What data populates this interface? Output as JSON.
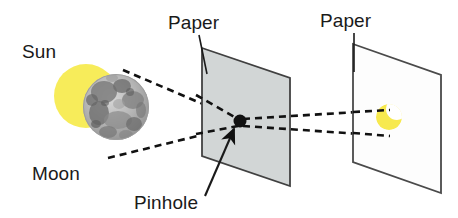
{
  "figure": {
    "title_visible": false,
    "background_color": "#ffffff",
    "topic": "pinhole-camera-solar-eclipse-projection"
  },
  "labels": [
    {
      "id": "sun",
      "text": "Sun",
      "x": 22,
      "y": 58,
      "anchor": "start"
    },
    {
      "id": "paper1",
      "text": "Paper",
      "x": 168,
      "y": 29,
      "anchor": "start"
    },
    {
      "id": "paper2",
      "text": "Paper",
      "x": 320,
      "y": 27,
      "anchor": "start"
    },
    {
      "id": "moon",
      "text": "Moon",
      "x": 32,
      "y": 180,
      "anchor": "start"
    },
    {
      "id": "pinhole",
      "text": "Pinhole",
      "x": 134,
      "y": 209,
      "anchor": "start"
    }
  ],
  "colors": {
    "sun_yellow": "#f7ec5a",
    "crescent_yellow": "#f7e94f",
    "moon_gray_light": "#c9c9c9",
    "moon_gray_mid": "#9b9b9b",
    "moon_gray_dark": "#6e6e6e",
    "paper_fill_gray": "#d2d6d6",
    "paper_fill_white": "#fdfdfd",
    "paper_stroke": "#4a4a4a",
    "ray_black": "#111111",
    "text_black": "#1a1a1a",
    "background": "#ffffff"
  },
  "objects": {
    "sun": {
      "name": "Sun",
      "shape": "circle",
      "center_x": 86,
      "center_y": 96,
      "radius": 32,
      "color": "#f7ec5a"
    },
    "moon": {
      "name": "Moon",
      "shape": "circle",
      "center_x": 116,
      "center_y": 107,
      "radius": 33,
      "color": "#9b9b9b",
      "description": "textured cratered gray disk overlapping the sun"
    },
    "paper_with_pinhole": {
      "name": "Paper",
      "shape": "parallelogram",
      "fill": "#d2d6d6",
      "points": "202,48 290,78 290,186 202,156",
      "has_pinhole": true
    },
    "pinhole": {
      "name": "Pinhole",
      "shape": "dot",
      "center_x": 240,
      "center_y": 121,
      "radius": 6.5,
      "color": "#111111"
    },
    "screen_paper": {
      "name": "Paper",
      "shape": "parallelogram",
      "fill": "#fdfdfd",
      "points": "353,44 441,75 441,193 353,162"
    },
    "projected_image": {
      "name": "crescent",
      "shape": "crescent",
      "center_x": 389,
      "center_y": 117,
      "radius": 13,
      "color": "#f7e94f",
      "description": "inverted crescent image of the partially eclipsed sun"
    }
  },
  "rays": {
    "style": "dashed",
    "dash_pattern": "7 5",
    "stroke_width": 2.6,
    "paths": [
      {
        "id": "ray-upper-to-pinhole",
        "from": "sun-top",
        "to": "pinhole",
        "d": "M 123,70 L 238,119"
      },
      {
        "id": "ray-lower-to-pinhole",
        "from": "moon-bottom",
        "to": "pinhole",
        "d": "M 108,158 L 238,126"
      },
      {
        "id": "ray-pinhole-to-screen-upper",
        "from": "pinhole",
        "to": "screen-lower",
        "d": "M 243,119 L 378,110"
      },
      {
        "id": "ray-pinhole-to-screen-lower",
        "from": "pinhole",
        "to": "screen-upper",
        "d": "M 243,126 L 378,135"
      }
    ]
  },
  "leaders": [
    {
      "id": "pinhole-leader",
      "from_label": "Pinhole",
      "to_object": "pinhole",
      "d": "M 206,196 L 236,127",
      "arrow": true
    },
    {
      "id": "paper1-leader",
      "from_label": "Paper",
      "to_object": "paper_with_pinhole",
      "d": "M 199,35 L 207,74",
      "arrow": false
    },
    {
      "id": "paper2-leader",
      "from_label": "Paper",
      "to_object": "screen_paper",
      "d": "M 354,33 L 354,72",
      "arrow": false
    }
  ]
}
